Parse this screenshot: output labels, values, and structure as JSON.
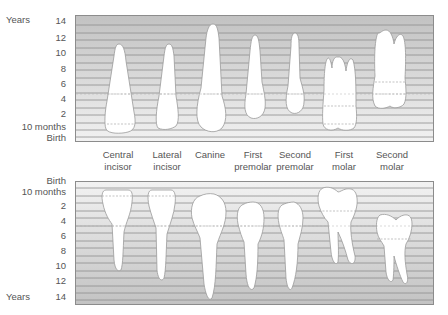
{
  "upper": {
    "axis_unit": "Years",
    "ticks": [
      "14",
      "12",
      "10",
      "8",
      "6",
      "4",
      "2",
      "10 months",
      "Birth"
    ]
  },
  "lower": {
    "axis_unit": "Years",
    "ticks": [
      "Birth",
      "10 months",
      "2",
      "4",
      "6",
      "8",
      "10",
      "12",
      "14"
    ]
  },
  "teeth": [
    {
      "line1": "Central",
      "line2": "incisor"
    },
    {
      "line1": "Lateral",
      "line2": "incisor"
    },
    {
      "line1": "Canine",
      "line2": ""
    },
    {
      "line1": "First",
      "line2": "premolar"
    },
    {
      "line1": "Second",
      "line2": "premolar"
    },
    {
      "line1": "First",
      "line2": "molar"
    },
    {
      "line1": "Second",
      "line2": "molar"
    }
  ],
  "colors": {
    "grid_dark": "#c4c4c4",
    "grid_light": "#f0f0f0",
    "gridline": "#8e8e8e",
    "tooth_fill": "#ffffff",
    "tooth_stroke": "#9a9a9a"
  }
}
